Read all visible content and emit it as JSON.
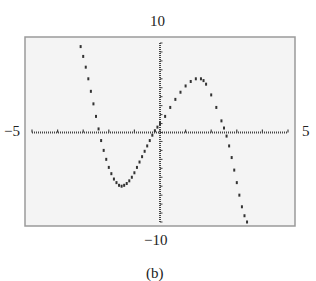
{
  "figure": {
    "caption": "(b)",
    "labels": {
      "ymax": "10",
      "ymin": "−10",
      "xmin": "−5",
      "xmax": "5"
    }
  },
  "colors": {
    "frame": "#9a9a9a",
    "plot_bg": "#f4f4f4",
    "axis": "#444444",
    "dots": "#333333"
  },
  "chart_data": {
    "type": "scatter",
    "title": "",
    "caption": "(b)",
    "xlabel": "",
    "ylabel": "",
    "xlim": [
      -5,
      5
    ],
    "ylim": [
      -10,
      10
    ],
    "x_tick_step": 1,
    "y_tick_step": 1,
    "grid": false,
    "series": [
      {
        "name": "curve",
        "x": [
          -3.1,
          -3.0,
          -2.9,
          -2.8,
          -2.7,
          -2.6,
          -2.5,
          -2.4,
          -2.3,
          -2.2,
          -2.1,
          -2.0,
          -1.9,
          -1.8,
          -1.7,
          -1.6,
          -1.5,
          -1.4,
          -1.3,
          -1.2,
          -1.1,
          -1.0,
          -0.9,
          -0.8,
          -0.7,
          -0.6,
          -0.5,
          -0.4,
          -0.3,
          -0.2,
          -0.1,
          0.0,
          0.2,
          0.4,
          0.6,
          0.8,
          1.0,
          1.2,
          1.4,
          1.6,
          1.7,
          1.8,
          2.0,
          2.2,
          2.4,
          2.5,
          2.6,
          2.7,
          2.8,
          2.9,
          3.0,
          3.1,
          3.2,
          3.3,
          3.4
        ],
        "y": [
          9.6,
          8.5,
          7.3,
          6.0,
          4.6,
          3.2,
          1.8,
          0.4,
          -0.9,
          -2.0,
          -3.0,
          -3.9,
          -4.6,
          -5.2,
          -5.6,
          -5.9,
          -6.0,
          -5.9,
          -5.7,
          -5.4,
          -5.0,
          -4.5,
          -3.9,
          -3.3,
          -2.7,
          -2.1,
          -1.5,
          -0.9,
          -0.3,
          0.2,
          0.6,
          1.0,
          1.8,
          2.8,
          3.7,
          4.5,
          5.2,
          5.7,
          6.0,
          6.0,
          5.8,
          5.4,
          4.2,
          2.8,
          1.3,
          0.5,
          -0.4,
          -1.5,
          -2.8,
          -4.2,
          -5.6,
          -7.0,
          -8.3,
          -9.3,
          -10.0
        ]
      }
    ]
  }
}
